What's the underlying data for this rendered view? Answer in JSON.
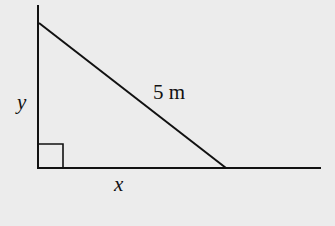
{
  "diagram": {
    "type": "right-triangle",
    "labels": {
      "vertical_side": "y",
      "horizontal_side": "x",
      "hypotenuse": "5 m"
    },
    "right_angle_marker": true,
    "colors": {
      "background": "#ececec",
      "stroke": "#111111"
    }
  }
}
